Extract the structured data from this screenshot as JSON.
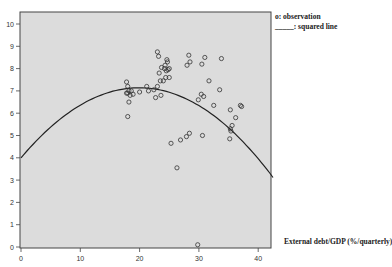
{
  "chart_data": {
    "type": "scatter",
    "title": "",
    "xlabel": "External debt/GDP (%/quarterly)",
    "ylabel": "",
    "xlim": [
      0,
      42.5
    ],
    "ylim": [
      0,
      10.4
    ],
    "xticks": [
      0,
      10,
      20,
      30,
      40
    ],
    "yticks": [
      0,
      1,
      2,
      3,
      4,
      5,
      6,
      7,
      8,
      9,
      10
    ],
    "grid": false,
    "legend_position": "top-right outside",
    "legend": [
      "o: observation",
      "_____: squared line"
    ],
    "series": [
      {
        "name": "observation",
        "kind": "scatter",
        "points": [
          [
            17.8,
            7.4
          ],
          [
            18.0,
            7.2
          ],
          [
            18.2,
            7.0
          ],
          [
            18.0,
            6.9
          ],
          [
            18.4,
            6.8
          ],
          [
            17.8,
            6.9
          ],
          [
            18.6,
            7.0
          ],
          [
            18.9,
            6.85
          ],
          [
            18.2,
            6.5
          ],
          [
            18.0,
            5.85
          ],
          [
            20.0,
            6.95
          ],
          [
            21.5,
            7.0
          ],
          [
            21.2,
            7.2
          ],
          [
            22.4,
            7.05
          ],
          [
            23.0,
            7.2
          ],
          [
            22.7,
            6.7
          ],
          [
            23.6,
            6.8
          ],
          [
            23.0,
            8.75
          ],
          [
            23.2,
            8.55
          ],
          [
            24.6,
            8.4
          ],
          [
            23.7,
            8.05
          ],
          [
            24.2,
            8.0
          ],
          [
            24.3,
            8.15
          ],
          [
            24.7,
            8.3
          ],
          [
            25.0,
            8.0
          ],
          [
            23.3,
            7.8
          ],
          [
            24.5,
            7.9
          ],
          [
            24.8,
            7.95
          ],
          [
            24.4,
            7.6
          ],
          [
            23.5,
            7.45
          ],
          [
            24.0,
            7.45
          ],
          [
            25.0,
            7.6
          ],
          [
            28.3,
            8.6
          ],
          [
            28.5,
            8.3
          ],
          [
            28.0,
            8.15
          ],
          [
            31.0,
            8.5
          ],
          [
            30.5,
            8.2
          ],
          [
            33.8,
            8.45
          ],
          [
            31.7,
            7.45
          ],
          [
            33.5,
            7.05
          ],
          [
            30.4,
            6.85
          ],
          [
            30.8,
            6.75
          ],
          [
            29.9,
            6.6
          ],
          [
            32.5,
            6.35
          ],
          [
            35.3,
            6.15
          ],
          [
            37.0,
            6.35
          ],
          [
            37.2,
            6.3
          ],
          [
            36.2,
            5.8
          ],
          [
            35.6,
            5.45
          ],
          [
            35.3,
            5.3
          ],
          [
            35.4,
            5.2
          ],
          [
            35.2,
            4.85
          ],
          [
            30.6,
            5.0
          ],
          [
            28.4,
            5.1
          ],
          [
            27.9,
            4.95
          ],
          [
            26.9,
            4.8
          ],
          [
            25.3,
            4.65
          ],
          [
            26.3,
            3.55
          ],
          [
            29.8,
            0.1
          ]
        ]
      },
      {
        "name": "squared line",
        "kind": "line",
        "equation": "y = 4.0 + 0.315x - 0.0079x^2",
        "x": [
          0,
          5,
          10,
          15,
          20,
          25,
          30,
          35,
          40,
          42.5
        ],
        "y": [
          4.0,
          5.38,
          6.36,
          6.95,
          7.14,
          6.94,
          6.34,
          5.35,
          3.96,
          4.55
        ]
      }
    ]
  },
  "legend": {
    "observation": "o: observation",
    "line": "_____: squared line"
  },
  "axis": {
    "xlabel": "External debt/GDP (%/quarterly)"
  }
}
